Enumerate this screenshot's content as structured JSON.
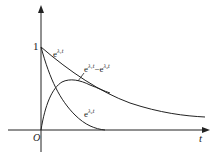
{
  "figure": {
    "type": "function-plot",
    "axes": {
      "x_label": "t",
      "origin_label": "O",
      "y_tick_label": "1"
    },
    "curves": [
      {
        "id": "exp-lambda1",
        "label_base": "e",
        "label_exp": "λ₁t",
        "label_text": "e^{λ1 t}",
        "description": "slow exponential decay starting at 1"
      },
      {
        "id": "exp-lambda2",
        "label_base": "e",
        "label_exp": "λ₂t",
        "label_text": "e^{λ2 t}",
        "description": "fast exponential decay starting at 1"
      },
      {
        "id": "difference",
        "label_base": "e",
        "label_exp1": "λ₁t",
        "label_mid": "−e",
        "label_exp2": "λ₂t",
        "label_text": "e^{λ1 t} − e^{λ2 t}",
        "description": "difference curve starting at 0, rising to a peak then decaying"
      }
    ],
    "colors": {
      "line": "#222222",
      "background": "#ffffff"
    }
  }
}
